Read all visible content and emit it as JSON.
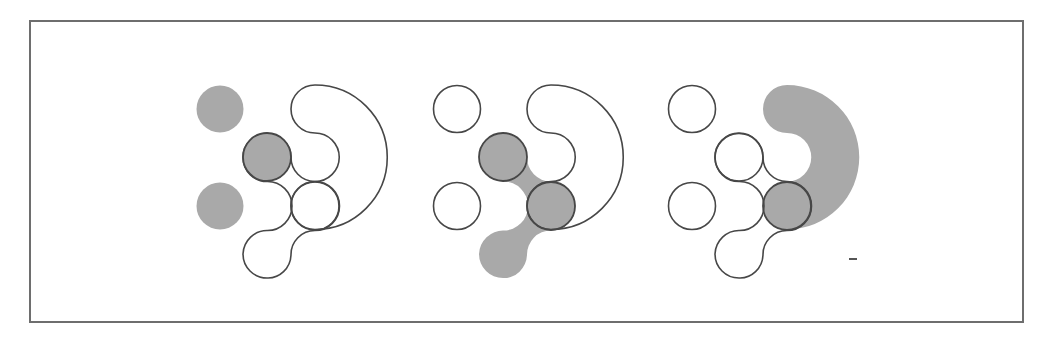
{
  "figure": {
    "colors": {
      "fill": "#a9a9a9",
      "stroke": "#474747",
      "frame": "#6e6e6e",
      "background": "#ffffff"
    },
    "frame": {
      "x": 30,
      "y": 21,
      "width": 993,
      "height": 301
    },
    "panels": [
      {
        "id": "panel-1",
        "offset_x": 0,
        "highlight": "left-circles-and-middle-circle"
      },
      {
        "id": "panel-2",
        "offset_x": 236,
        "highlight": "chain-shape"
      },
      {
        "id": "panel-3",
        "offset_x": 472,
        "highlight": "crescent-shape"
      }
    ],
    "mark": {
      "x": 849,
      "y": 259,
      "width": 8
    }
  }
}
